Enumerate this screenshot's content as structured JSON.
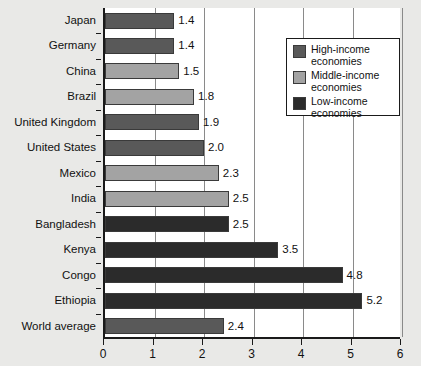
{
  "chart_data": {
    "type": "bar",
    "orientation": "horizontal",
    "title": "",
    "xlabel": "",
    "ylabel": "",
    "xlim": [
      0,
      6
    ],
    "xticks": [
      "0",
      "1",
      "2",
      "3",
      "4",
      "5",
      "6"
    ],
    "grid": "vertical",
    "legend_position": "top-right",
    "categories": [
      "Japan",
      "Germany",
      "China",
      "Brazil",
      "United Kingdom",
      "United States",
      "Mexico",
      "India",
      "Bangladesh",
      "Kenya",
      "Congo",
      "Ethiopia",
      "World average"
    ],
    "values": [
      1.4,
      1.4,
      1.5,
      1.8,
      1.9,
      2.0,
      2.3,
      2.5,
      2.5,
      3.5,
      4.8,
      5.2,
      2.4
    ],
    "value_labels": [
      "1.4",
      "1.4",
      "1.5",
      "1.8",
      "1.9",
      "2.0",
      "2.3",
      "2.5",
      "2.5",
      "3.5",
      "4.8",
      "5.2",
      "2.4"
    ],
    "groups": [
      "high-income",
      "high-income",
      "middle-income",
      "middle-income",
      "high-income",
      "high-income",
      "middle-income",
      "middle-income",
      "low-income",
      "low-income",
      "low-income",
      "low-income",
      "high-income"
    ]
  },
  "legend": {
    "items": [
      {
        "label": "High-income\neconomies",
        "color": "#595959",
        "key": "high-income"
      },
      {
        "label": "Middle-income\neconomies",
        "color": "#a3a3a3",
        "key": "middle-income"
      },
      {
        "label": "Low-income\neconomies",
        "color": "#2b2b2b",
        "key": "low-income"
      }
    ]
  },
  "colors": {
    "high_income": "#595959",
    "middle_income": "#a3a3a3",
    "low_income": "#2b2b2b",
    "background": "#e9e9e7",
    "plot_background": "#ffffff",
    "axis": "#1a1a1a",
    "gridline": "#8a8a8a",
    "text": "#111111"
  }
}
